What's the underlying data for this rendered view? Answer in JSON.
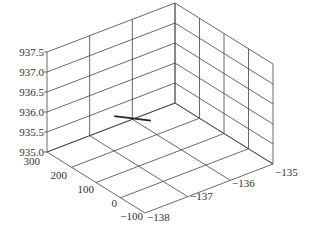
{
  "chart_data": {
    "type": "line3d",
    "title": "",
    "xlabel": "",
    "ylabel": "",
    "zlabel": "",
    "x_axis": {
      "ticks": [
        -138,
        -137,
        -136,
        -135
      ],
      "range": [
        -138,
        -135
      ]
    },
    "y_axis": {
      "ticks": [
        -100,
        0,
        100,
        200,
        300
      ],
      "range": [
        -100,
        300
      ]
    },
    "z_axis": {
      "ticks": [
        935.0,
        935.5,
        936.0,
        936.5,
        937.0,
        937.5
      ],
      "range": [
        935.0,
        937.5
      ]
    },
    "grid": true,
    "series": [
      {
        "name": "trajectory",
        "color": "#222222",
        "points": [
          {
            "x": -137.4,
            "y": 130,
            "z": 936.3
          },
          {
            "x": -136.6,
            "y": 120,
            "z": 935.9
          }
        ]
      }
    ]
  },
  "labels": {
    "z_ticks": [
      "937.5",
      "937.0",
      "936.5",
      "936.0",
      "935.5",
      "935.0"
    ],
    "y_ticks": [
      "300",
      "200",
      "100",
      "0",
      "−100"
    ],
    "x_ticks": [
      "−138",
      "−137",
      "−136",
      "−135"
    ]
  }
}
